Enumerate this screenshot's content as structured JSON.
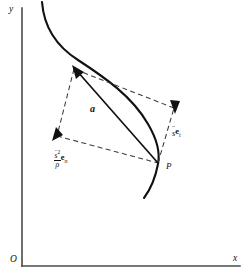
{
  "figure": {
    "kind": "vector-decomposition-diagram",
    "background_color": "#ffffff",
    "ink_color": "#111111",
    "axes": {
      "origin_label": "O",
      "x_axis_label": "x",
      "y_axis_label": "y",
      "axis_color": "#4a4a4a"
    },
    "point_label": "P",
    "acceleration_vector_label": "a",
    "tangential_term": {
      "coefficient_symbol": "s",
      "coefficient_accent": "double-dot",
      "basis_symbol": "e",
      "basis_subscript": "t",
      "plain_text": "s̈ e_t"
    },
    "normal_term": {
      "numerator_symbol": "s",
      "numerator_accent": "dot",
      "numerator_exponent": "2",
      "denominator_symbol": "ρ",
      "basis_symbol": "e",
      "basis_subscript": "n",
      "plain_text": "(ṡ²/ρ) e_n"
    }
  }
}
